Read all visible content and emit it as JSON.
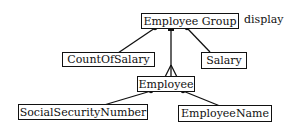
{
  "diagram": {
    "root": {
      "label": "Employee Group",
      "annotation": "display"
    },
    "attributes_of_root": [
      {
        "label": "CountOfSalary"
      },
      {
        "label": "Salary"
      }
    ],
    "child": {
      "label": "Employee"
    },
    "attributes_of_child": [
      {
        "label": "SocialSecurityNumber"
      },
      {
        "label": "EmployeeName"
      }
    ],
    "colors": {
      "line": "#111111",
      "background": "#ffffff"
    }
  }
}
